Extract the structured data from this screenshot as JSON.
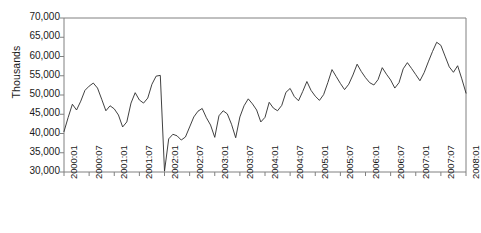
{
  "chart_data": {
    "type": "line",
    "title": "",
    "xlabel": "",
    "ylabel": "Thousands",
    "ylim": [
      30000,
      70000
    ],
    "ytick_step": 5000,
    "ytick_labels": [
      "30,000",
      "35,000",
      "40,000",
      "45,000",
      "50,000",
      "55,000",
      "60,000",
      "65,000",
      "70,000"
    ],
    "ytick_values": [
      30000,
      35000,
      40000,
      45000,
      50000,
      55000,
      60000,
      65000,
      70000
    ],
    "grid": false,
    "legend": false,
    "legend_position": "none",
    "xtick_labels": [
      "2000:01",
      "2000:07",
      "2001:01",
      "2001:07",
      "2002:01",
      "2002:07",
      "2003:01",
      "2003:07",
      "2004:01",
      "2004:07",
      "2005:01",
      "2005:07",
      "2006:01",
      "2006:07",
      "2007:01",
      "2007:07",
      "2008:01"
    ],
    "xtick_interval_months": 6,
    "x_start": "2000:01",
    "x_end": "2008:01",
    "x_count": 97,
    "line_color": "#2b2b2b",
    "axis_color": "#808080",
    "series": [
      {
        "name": "Monthly series",
        "values": [
          40500,
          44200,
          47600,
          46100,
          48400,
          51200,
          52300,
          53100,
          51800,
          48900,
          45900,
          47200,
          46400,
          44800,
          41700,
          43000,
          47900,
          50600,
          48700,
          47900,
          49200,
          52800,
          54900,
          55100,
          30200,
          38600,
          39800,
          39400,
          38300,
          39100,
          41700,
          44300,
          45800,
          46500,
          44100,
          42200,
          39000,
          44600,
          45900,
          45100,
          42400,
          38900,
          44300,
          47200,
          49000,
          47700,
          46100,
          43000,
          44200,
          48100,
          46600,
          45900,
          47300,
          50700,
          51700,
          49600,
          48500,
          50900,
          53500,
          51200,
          49700,
          48600,
          50100,
          53200,
          56600,
          54800,
          53000,
          51400,
          52800,
          55200,
          58000,
          56100,
          54500,
          53200,
          52600,
          54000,
          57100,
          55400,
          53900,
          51800,
          53200,
          56800,
          58400,
          56900,
          55300,
          53700,
          55800,
          58600,
          61300,
          63700,
          62900,
          60100,
          57300,
          55900,
          57600,
          54200,
          50500
        ]
      }
    ]
  }
}
